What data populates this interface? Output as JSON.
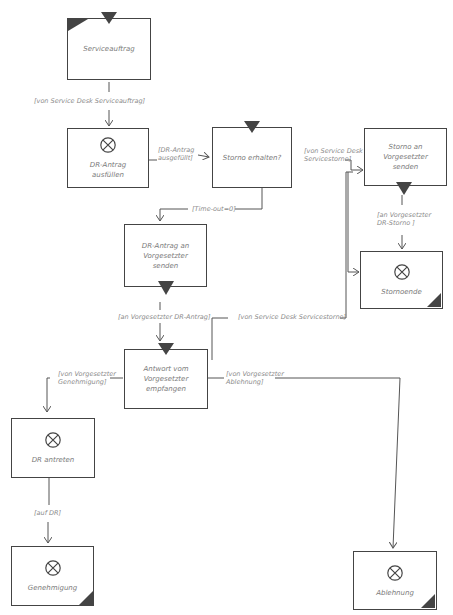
{
  "diagram": {
    "type": "process-flow",
    "style": "hand-drawn",
    "colors": {
      "stroke": "#444444",
      "text": "#7a7a7a",
      "background": "#ffffff"
    },
    "nodes": {
      "serviceauftrag": {
        "label": "Serviceauftrag",
        "icon": "start-event"
      },
      "dr_antrag_ausfuellen": {
        "label": "DR-Antrag ausfüllen",
        "icon": "x-circle-icon"
      },
      "storno_erhalten": {
        "label": "Storno erhalten?",
        "icon": "receive-triangle"
      },
      "storno_an_vorgesetzter": {
        "label": "Storno an Vorgesetzter senden",
        "icon": "send-triangle"
      },
      "stornoende": {
        "label": "Stornoende",
        "icon": "x-circle-icon"
      },
      "dr_antrag_an_vorgesetzter": {
        "label": "DR-Antrag an Vorgesetzter senden",
        "icon": "send-triangle"
      },
      "antwort_empfangen": {
        "label": "Antwort vom Vorgesetzter empfangen",
        "icon": "receive-triangle"
      },
      "dr_antreten": {
        "label": "DR antreten",
        "icon": "x-circle-icon"
      },
      "genehmigung": {
        "label": "Genehmigung",
        "icon": "x-circle-icon"
      },
      "ablehnung": {
        "label": "Ablehnung",
        "icon": "x-circle-icon"
      }
    },
    "edges": {
      "e1": "[von Service Desk Serviceauftrag]",
      "e2": "[DR-Antrag\nausgefüllt]",
      "e3": "[Time-out=0]",
      "e4": "[von Service Desk\nServicestorno]",
      "e5": "[an Vorgesetzter\nDR-Storno ]",
      "e6": "[an Vorgesetzter DR-Antrag]",
      "e7": "[von Service Desk Servicestorno]",
      "e8": "[von Vorgesetzter\nGenehmigung]",
      "e9": "[von Vorgesetzter\nAblehnung]",
      "e10": "[auf DR]"
    }
  }
}
